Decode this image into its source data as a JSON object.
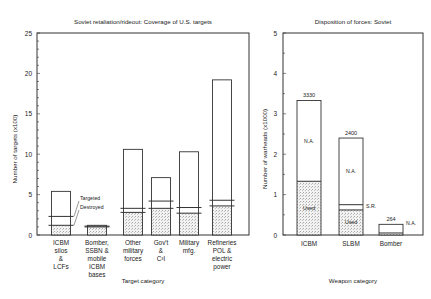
{
  "chart_data": [
    {
      "type": "bar",
      "title": "Soviet retaliation/rideout: Coverage of U.S. targets",
      "xlabel": "Target category",
      "ylabel": "Number of targets (x100)",
      "ylim": [
        0,
        25
      ],
      "yticks": [
        0,
        5,
        10,
        15,
        20,
        25
      ],
      "categories": [
        [
          "ICBM",
          "silos",
          "&",
          "LCFs"
        ],
        [
          "Bomber,",
          "SSBN &",
          "mobile",
          "ICBM",
          "bases"
        ],
        [
          "Other",
          "military",
          "forces"
        ],
        [
          "Gov't",
          "&",
          "C³I"
        ],
        [
          "Military",
          "mfg."
        ],
        [
          "Refineries",
          "POL &",
          "electric",
          "power"
        ]
      ],
      "series": [
        {
          "name": "Total",
          "values": [
            5.4,
            1.2,
            10.6,
            7.1,
            10.3,
            19.2
          ]
        },
        {
          "name": "Targeted",
          "values": [
            2.3,
            1.1,
            3.3,
            4.2,
            3.4,
            4.3
          ]
        },
        {
          "name": "Destroyed",
          "values": [
            1.2,
            1.0,
            2.8,
            3.3,
            2.7,
            3.6
          ]
        }
      ],
      "annotations": [
        "Targeted",
        "Destroyed"
      ],
      "grid": false
    },
    {
      "type": "bar",
      "title": "Disposition of forces: Soviet",
      "xlabel": "Weapon category",
      "ylabel": "Number of warheads (x1000)",
      "ylim": [
        0,
        5
      ],
      "yticks": [
        0,
        1,
        2,
        3,
        4,
        5
      ],
      "categories": [
        "ICBM",
        "SLBM",
        "Bomber"
      ],
      "totals": [
        3330,
        2400,
        264
      ],
      "series": [
        {
          "name": "Used",
          "values": [
            1.33,
            0.62,
            0.05
          ]
        },
        {
          "name": "S.R.",
          "values": [
            0,
            0.13,
            0
          ]
        },
        {
          "name": "N.A.",
          "values": [
            2.0,
            1.65,
            0.214
          ]
        }
      ],
      "bar_labels": [
        "3330",
        "2400",
        "264"
      ],
      "segment_labels": {
        "used": "Used",
        "sr": "S.R.",
        "na": "N.A."
      },
      "grid": false
    }
  ]
}
